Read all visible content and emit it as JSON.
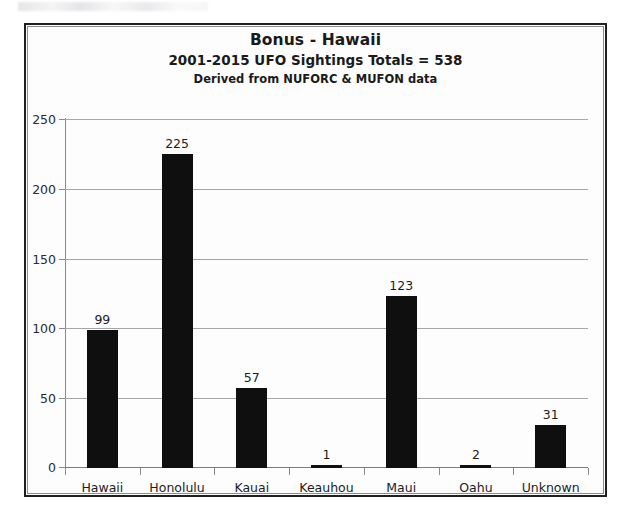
{
  "chart_data": {
    "type": "bar",
    "title": "Bonus - Hawaii",
    "subtitle": "2001-2015 UFO Sightings Totals = 538",
    "note": "Derived from NUFORC & MUFON data",
    "categories": [
      "Hawaii",
      "Honolulu",
      "Kauai",
      "Keauhou",
      "Maui",
      "Oahu",
      "Unknown"
    ],
    "values": [
      99,
      225,
      57,
      1,
      123,
      2,
      31
    ],
    "total": 538,
    "xlabel": "",
    "ylabel": "",
    "ylim": [
      0,
      250
    ],
    "yticks": [
      0,
      50,
      100,
      150,
      200,
      250
    ],
    "grid": true,
    "legend": false,
    "bar_color": "#100f0f",
    "background_color": "#fdfdfd",
    "gridline_color": "#a6a6a6",
    "frame_color": "#231f20"
  }
}
